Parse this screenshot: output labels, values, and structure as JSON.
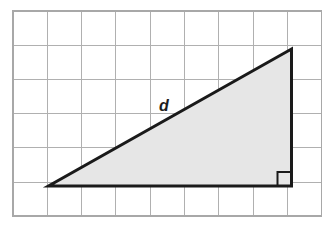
{
  "grid": {
    "columns": 9,
    "rows": 6,
    "cell_width": 34.3,
    "cell_height": 34.2,
    "origin_x": 13,
    "origin_y": 11,
    "line_color": "#b0b0b0",
    "border_color": "#a8a8a8",
    "background_color": "#ffffff",
    "line_width": 1,
    "border_width": 1.5
  },
  "triangle": {
    "name": "right-triangle",
    "fill_color": "#e6e6e6",
    "stroke_color": "#1a1a1a",
    "stroke_width": 3,
    "vertices": [
      {
        "name": "bottom-left-vertex",
        "x": 48.5,
        "y": 186.0
      },
      {
        "name": "bottom-right-vertex",
        "x": 291.5,
        "y": 186.0
      },
      {
        "name": "top-right-vertex",
        "x": 291.5,
        "y": 49.0
      }
    ],
    "points_attr": "48.5,186 291.5,186 291.5,49",
    "base_cells": 7,
    "height_cells": 4
  },
  "right_angle_marker": {
    "name": "right-angle-marker",
    "size": 14,
    "x": 277.5,
    "y": 172.0,
    "stroke_color": "#1a1a1a",
    "stroke_width": 2,
    "path_attr": "M 277.5 186 L 277.5 172 L 291.5 172"
  },
  "labels": {
    "hypotenuse": {
      "name": "hypotenuse-label",
      "text": "d",
      "x": 164,
      "y": 111,
      "color": "#1d1d1d",
      "font_size": 16
    }
  }
}
